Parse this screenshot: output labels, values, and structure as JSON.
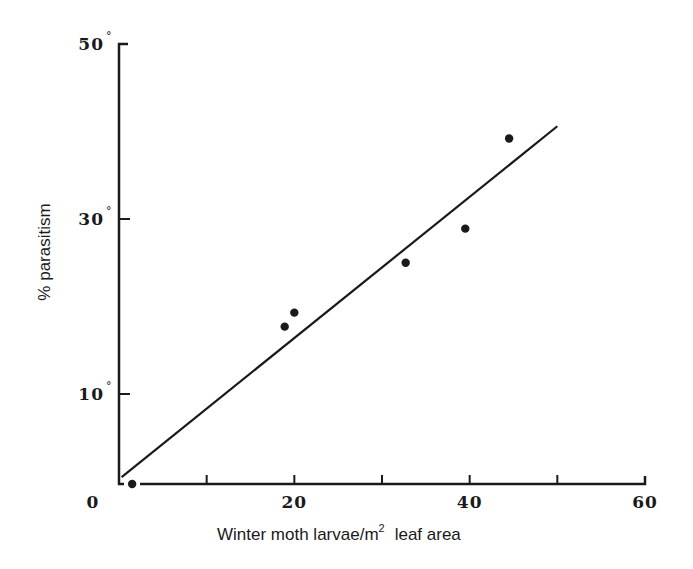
{
  "chart_data": {
    "type": "scatter",
    "title": "",
    "xlabel": "Winter moth larvae/m",
    "xlabel_superscript": "2",
    "xlabel_suffix": "leaf area",
    "ylabel": "% parasitism",
    "xlim": [
      0,
      60
    ],
    "ylim": [
      0,
      50
    ],
    "x_ticks": [
      0,
      10,
      20,
      30,
      40,
      50,
      60
    ],
    "x_tick_labels": [
      {
        "value": 0,
        "label": "0"
      },
      {
        "value": 20,
        "label": "20"
      },
      {
        "value": 40,
        "label": "40"
      },
      {
        "value": 60,
        "label": "60"
      }
    ],
    "y_ticks": [
      10,
      30,
      50
    ],
    "y_tick_labels": [
      {
        "value": 10,
        "label": "10",
        "suffix": "°"
      },
      {
        "value": 30,
        "label": "30",
        "suffix": "°"
      },
      {
        "value": 50,
        "label": "50",
        "suffix": "°"
      }
    ],
    "grid": false,
    "legend": null,
    "points": [
      {
        "x": 1.5,
        "y": 0
      },
      {
        "x": 18.9,
        "y": 17.7
      },
      {
        "x": 20.0,
        "y": 19.3
      },
      {
        "x": 32.7,
        "y": 25.0
      },
      {
        "x": 39.5,
        "y": 28.9
      },
      {
        "x": 44.5,
        "y": 39.2
      }
    ],
    "fit_line": {
      "x": [
        0.3,
        50
      ],
      "y": [
        0.5,
        40.6
      ]
    },
    "colors": {
      "ink": "#1a1a1a",
      "background": "#ffffff"
    }
  }
}
